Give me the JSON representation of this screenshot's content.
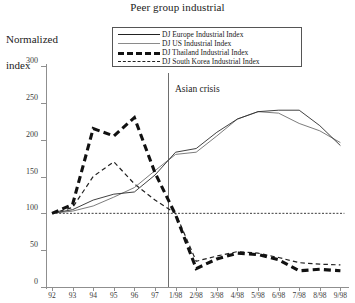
{
  "chart_data": {
    "type": "line",
    "title": "Peer group industrial",
    "ylabel": "Normalized\nindex",
    "xlabel": "",
    "ylim": [
      0,
      300
    ],
    "yticks": [
      0,
      50,
      100,
      150,
      200,
      250,
      300
    ],
    "grid": false,
    "legend_position": "top-center",
    "categories": [
      "92",
      "93",
      "94",
      "95",
      "96",
      "97",
      "1/98",
      "2/98",
      "3/98",
      "4/98",
      "5/98",
      "6/98",
      "7/98",
      "8/98",
      "9/98"
    ],
    "series": [
      {
        "name": "DJ Europe Industrial Index",
        "style": "solid-thin-dark",
        "color": "#2b2b2b",
        "values": [
          100,
          105,
          118,
          126,
          129,
          152,
          183,
          188,
          210,
          228,
          238,
          240,
          240,
          219,
          192
        ]
      },
      {
        "name": "DJ US Industrial Index",
        "style": "solid-thin-grey",
        "color": "#6d6d6d",
        "values": [
          100,
          103,
          110,
          122,
          135,
          158,
          180,
          183,
          205,
          228,
          238,
          236,
          222,
          212,
          196
        ]
      },
      {
        "name": "DJ Thailand Industrial Index",
        "style": "thick-dashed",
        "color": "#111111",
        "values": [
          100,
          112,
          215,
          205,
          230,
          155,
          98,
          25,
          38,
          46,
          44,
          37,
          22,
          24,
          22
        ]
      },
      {
        "name": "DJ South Korea Industrial Index",
        "style": "thin-dashed",
        "color": "#222222",
        "values": [
          100,
          108,
          150,
          170,
          140,
          118,
          100,
          35,
          42,
          48,
          46,
          40,
          33,
          31,
          30
        ]
      }
    ],
    "reference_line": {
      "value": 100,
      "style": "dotted"
    },
    "annotations": [
      {
        "text": "Asian crisis",
        "x_category": "97",
        "type": "vertical-line-label"
      }
    ]
  },
  "legend": {
    "items": [
      {
        "label": "DJ Europe Industrial Index"
      },
      {
        "label": "DJ US Industrial Index"
      },
      {
        "label": "DJ Thailand Industrial Index"
      },
      {
        "label": "DJ South Korea Industrial Index"
      }
    ]
  },
  "axis": {
    "y_label_line1": "Normalized",
    "y_label_line2": "index"
  }
}
